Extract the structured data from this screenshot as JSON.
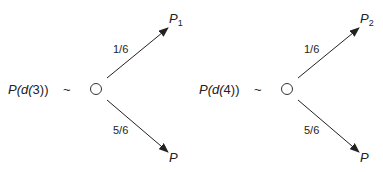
{
  "diagrams": [
    {
      "lottery_label_prefix": "P(d(",
      "lottery_arg": "3",
      "lottery_label_suffix": "))",
      "tilde": "~",
      "upper_prob": "1/6",
      "lower_prob": "5/6",
      "upper_outcome": "P",
      "upper_outcome_sub": "1",
      "lower_outcome": "P"
    },
    {
      "lottery_label_prefix": "P(d(",
      "lottery_arg": "4",
      "lottery_label_suffix": "))",
      "tilde": "~",
      "upper_prob": "1/6",
      "lower_prob": "5/6",
      "upper_outcome": "P",
      "upper_outcome_sub": "2",
      "lower_outcome": "P"
    }
  ]
}
